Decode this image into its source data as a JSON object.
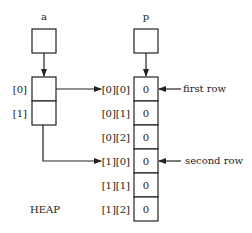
{
  "diagram": {
    "pointer_a": {
      "label": "a",
      "slots": [
        "[0]",
        "[1]"
      ]
    },
    "pointer_p": {
      "label": "p"
    },
    "heap_label": "HEAP",
    "heap_cells": [
      {
        "index": "[0][0]",
        "value": "0"
      },
      {
        "index": "[0][1]",
        "value": "0"
      },
      {
        "index": "[0][2]",
        "value": "0"
      },
      {
        "index": "[1][0]",
        "value": "0"
      },
      {
        "index": "[1][1]",
        "value": "0"
      },
      {
        "index": "[1][2]",
        "value": "0"
      }
    ],
    "annotations": {
      "first_row": "first row",
      "second_row": "second row"
    }
  }
}
